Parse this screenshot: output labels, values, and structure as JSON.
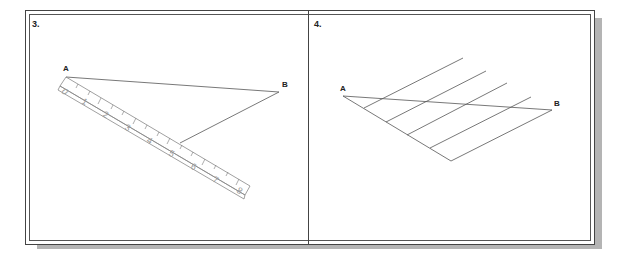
{
  "figure": {
    "panels": [
      {
        "label": "3.",
        "points": {
          "a": "A",
          "b": "B"
        },
        "ruler_numbers": [
          "0",
          "1",
          "2",
          "3",
          "4",
          "5",
          "6",
          "7",
          "8"
        ]
      },
      {
        "label": "4.",
        "points": {
          "a": "A",
          "b": "B"
        }
      }
    ]
  }
}
